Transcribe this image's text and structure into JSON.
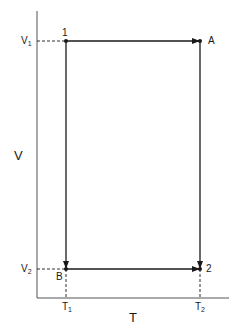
{
  "diagram": {
    "type": "V-T cycle diagram",
    "axes": {
      "x_label": "T",
      "y_label": "V",
      "x_ticks": [
        {
          "base": "T",
          "sub": "1"
        },
        {
          "base": "T",
          "sub": "2"
        }
      ],
      "y_ticks": [
        {
          "base": "V",
          "sub": "1"
        },
        {
          "base": "V",
          "sub": "2"
        }
      ]
    },
    "points": [
      {
        "id": "1",
        "label": "1",
        "T": "T1",
        "V": "V1"
      },
      {
        "id": "A",
        "label": "A",
        "T": "T2",
        "V": "V1"
      },
      {
        "id": "2",
        "label": "2",
        "T": "T2",
        "V": "V2"
      },
      {
        "id": "B",
        "label": "B",
        "T": "T1",
        "V": "V2"
      }
    ],
    "paths": [
      {
        "from": "1",
        "to": "A",
        "direction": "right"
      },
      {
        "from": "A",
        "to": "2",
        "direction": "down"
      },
      {
        "from": "1",
        "to": "B",
        "direction": "down"
      },
      {
        "from": "B",
        "to": "2",
        "direction": "right"
      }
    ],
    "colors": {
      "line": "#1a1a1a",
      "background": "#ffffff"
    }
  }
}
